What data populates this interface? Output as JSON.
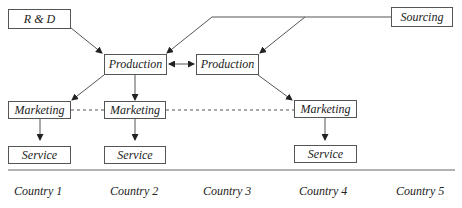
{
  "diagram": {
    "nodes": {
      "rnd": "R & D",
      "sourcing": "Sourcing",
      "production_1": "Production",
      "production_2": "Production",
      "marketing_1": "Marketing",
      "marketing_2": "Marketing",
      "marketing_3": "Marketing",
      "service_1": "Service",
      "service_2": "Service",
      "service_3": "Service"
    },
    "countries": [
      "Country 1",
      "Country 2",
      "Country 3",
      "Country 4",
      "Country 5"
    ],
    "edges": [
      {
        "from": "rnd",
        "to": "production_1",
        "style": "arrow"
      },
      {
        "from": "sourcing",
        "to": "production_1",
        "style": "arrow"
      },
      {
        "from": "sourcing",
        "to": "production_2",
        "style": "arrow"
      },
      {
        "from": "production_1",
        "to": "production_2",
        "style": "double-arrow"
      },
      {
        "from": "production_1",
        "to": "marketing_1",
        "style": "arrow"
      },
      {
        "from": "production_1",
        "to": "marketing_2",
        "style": "arrow"
      },
      {
        "from": "production_2",
        "to": "marketing_3",
        "style": "arrow"
      },
      {
        "from": "marketing_1",
        "to": "service_1",
        "style": "arrow"
      },
      {
        "from": "marketing_2",
        "to": "service_2",
        "style": "arrow"
      },
      {
        "from": "marketing_3",
        "to": "service_3",
        "style": "arrow"
      },
      {
        "from": "marketing_1",
        "to": "marketing_3",
        "style": "dashed"
      }
    ],
    "colors": {
      "line": "#555555",
      "text": "#222222",
      "background": "#ffffff"
    }
  }
}
